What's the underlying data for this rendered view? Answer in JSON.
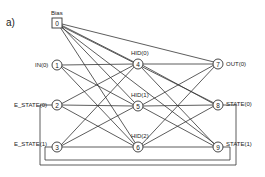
{
  "figure_label": "a)",
  "nodes": [
    {
      "id": "0",
      "label": "Bias",
      "shape": "square",
      "x": 57,
      "y": 23
    },
    {
      "id": "1",
      "label": "IN(0)",
      "shape": "circle",
      "x": 57,
      "y": 65
    },
    {
      "id": "2",
      "label": "E_STATE(0)",
      "shape": "circle",
      "x": 57,
      "y": 105
    },
    {
      "id": "3",
      "label": "E_STATE(1)",
      "shape": "circle",
      "x": 57,
      "y": 147
    },
    {
      "id": "4",
      "label": "HID(0)",
      "shape": "circle",
      "x": 138,
      "y": 64
    },
    {
      "id": "5",
      "label": "HID(1)",
      "shape": "circle",
      "x": 138,
      "y": 106
    },
    {
      "id": "6",
      "label": "HID(2)",
      "shape": "circle",
      "x": 138,
      "y": 147
    },
    {
      "id": "7",
      "label": "OUT(0)",
      "shape": "circle",
      "x": 218,
      "y": 64
    },
    {
      "id": "8",
      "label": "STATE(0)",
      "shape": "circle",
      "x": 218,
      "y": 105
    },
    {
      "id": "9",
      "label": "STATE(1)",
      "shape": "circle",
      "x": 218,
      "y": 147
    }
  ],
  "feedback": [
    {
      "from": "8",
      "to": "2"
    },
    {
      "from": "9",
      "to": "3"
    }
  ]
}
